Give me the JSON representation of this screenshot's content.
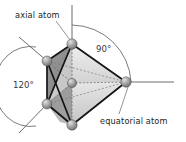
{
  "figure": {
    "background_color": "#ffffff",
    "width": 186,
    "height": 142
  },
  "labels": {
    "axial_atom": "axial atom",
    "equatorial_atom": "equatorial atom",
    "angle_axial_equatorial": "90°",
    "angle_equatorial_equatorial": "120°"
  },
  "geometry": {
    "shape": "trigonal bipyramid",
    "center_atom": {
      "x": 72,
      "y": 83
    },
    "vertices": [
      {
        "name": "axial-top",
        "x": 72,
        "y": 44
      },
      {
        "name": "axial-bottom",
        "x": 72,
        "y": 125
      },
      {
        "name": "equatorial-left-back",
        "x": 47,
        "y": 61
      },
      {
        "name": "equatorial-left-front",
        "x": 47,
        "y": 104
      },
      {
        "name": "equatorial-right",
        "x": 126,
        "y": 82
      }
    ]
  },
  "colors": {
    "outline": "#1a1a1a",
    "face_dark": "#8d8d8d",
    "face_mid": "#a8a8a8",
    "face_light": "#d8d8d8",
    "face_lightest": "#ececec",
    "atom_fill": "#8a8a8a",
    "atom_highlight": "#d9d9d9",
    "axis_line": "#6f6b6c",
    "arc_line": "#6f6b6c",
    "leader_line": "#8c8889",
    "text": "#231f20"
  }
}
